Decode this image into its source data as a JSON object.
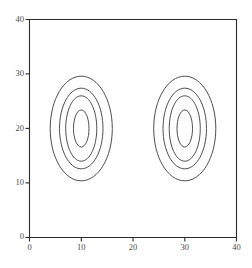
{
  "chart_data": {
    "type": "contour",
    "title": "",
    "xlabel": "",
    "ylabel": "",
    "xlim": [
      0,
      40
    ],
    "ylim": [
      0,
      40
    ],
    "xticks": [
      0,
      10,
      20,
      30,
      40
    ],
    "yticks": [
      0,
      10,
      20,
      30,
      40
    ],
    "xtick_labels": [
      "0",
      "10",
      "20",
      "30",
      "40"
    ],
    "ytick_labels": [
      "0",
      "10",
      "20",
      "30",
      "40"
    ],
    "grid": false,
    "legend": null,
    "frame": "box",
    "background_color": "#ffffff",
    "line_color": "#3a3a3a",
    "axis_color": "#2b2b2b",
    "contour_groups": [
      {
        "name": "left-peak",
        "center_x": 10,
        "center_y": 20,
        "rings": [
          {
            "level": 1,
            "rx": 6.0,
            "ry": 9.6
          },
          {
            "level": 2,
            "rx": 4.2,
            "ry": 7.4
          },
          {
            "level": 3,
            "rx": 3.0,
            "ry": 6.0
          },
          {
            "level": 4,
            "rx": 1.5,
            "ry": 3.4
          }
        ]
      },
      {
        "name": "right-peak",
        "center_x": 30,
        "center_y": 20,
        "rings": [
          {
            "level": 1,
            "rx": 6.0,
            "ry": 9.6
          },
          {
            "level": 2,
            "rx": 4.2,
            "ry": 7.4
          },
          {
            "level": 3,
            "rx": 3.0,
            "ry": 6.0
          },
          {
            "level": 4,
            "rx": 1.5,
            "ry": 3.4
          }
        ]
      }
    ]
  }
}
